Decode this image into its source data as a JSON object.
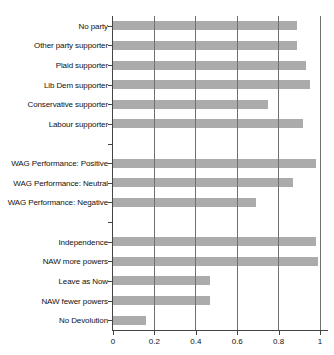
{
  "chart_data": {
    "type": "bar",
    "orientation": "horizontal",
    "xlim": [
      0,
      1
    ],
    "x_ticks": [
      "0",
      "0.2",
      "0.4",
      "0.6",
      "0.8",
      "1"
    ],
    "grid": true,
    "bar_color": "#ababab",
    "gridline_color": "#707070",
    "axis_color": "#444444",
    "groups": [
      {
        "items": [
          {
            "label": "No party",
            "value": 0.89
          },
          {
            "label": "Other party supporter",
            "value": 0.89
          },
          {
            "label": "Plaid supporter",
            "value": 0.93
          },
          {
            "label": "Lib Dem supporter",
            "value": 0.95
          },
          {
            "label": "Conservative supporter",
            "value": 0.75
          },
          {
            "label": "Labour supporter",
            "value": 0.92
          }
        ]
      },
      {
        "items": [
          {
            "label": "WAG Performance: Positive",
            "value": 0.98
          },
          {
            "label": "WAG Performance: Neutral",
            "value": 0.87
          },
          {
            "label": "WAG Performance: Negative",
            "value": 0.69
          }
        ]
      },
      {
        "items": [
          {
            "label": "Independence",
            "value": 0.98
          },
          {
            "label": "NAW more powers",
            "value": 0.99
          },
          {
            "label": "Leave as Now",
            "value": 0.47
          },
          {
            "label": "NAW fewer powers",
            "value": 0.47
          },
          {
            "label": "No Devolution",
            "value": 0.16
          }
        ]
      }
    ]
  }
}
